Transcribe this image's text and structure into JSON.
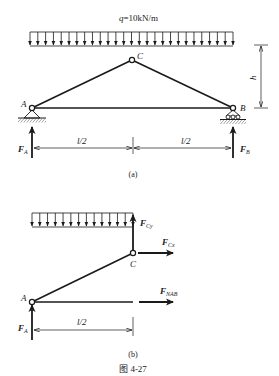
{
  "figure": {
    "caption": "图 4-27",
    "panel_a": {
      "label": "(a)",
      "load_label": "q=10kN/m",
      "load_q": "q",
      "load_value": "=10kN/m",
      "nodes": {
        "A": "A",
        "B": "B",
        "C": "C"
      },
      "height_label": "h",
      "span_left": "l/2",
      "span_right": "l/2",
      "forces": {
        "FA": {
          "main": "F",
          "sub": "A"
        },
        "FB": {
          "main": "F",
          "sub": "B"
        }
      }
    },
    "panel_b": {
      "label": "(b)",
      "nodes": {
        "A": "A",
        "C": "C"
      },
      "span": "l/2",
      "forces": {
        "FCy": {
          "main": "F",
          "sub": "Cy"
        },
        "FCx": {
          "main": "F",
          "sub": "Cx"
        },
        "FNAB": {
          "main": "F",
          "sub": "NAB"
        },
        "FA": {
          "main": "F",
          "sub": "A"
        }
      }
    }
  },
  "colors": {
    "line": "#1a1a1a",
    "text": "#222222",
    "background": "#ffffff"
  }
}
